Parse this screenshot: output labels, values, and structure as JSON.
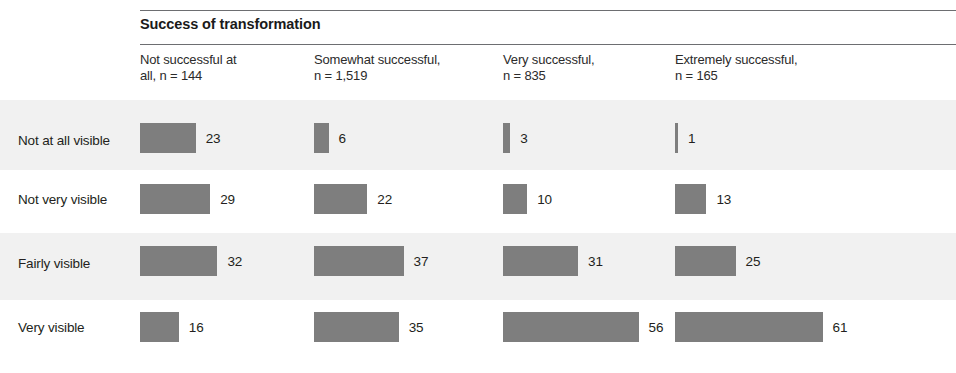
{
  "chart_data": {
    "type": "bar",
    "title": "Success of transformation",
    "orientation": "horizontal",
    "grouped_by": "column",
    "grid": false,
    "legend": "none",
    "xlabel": "",
    "ylabel": "",
    "value_unit": "percent",
    "categories": [
      "Not at all visible",
      "Not very visible",
      "Fairly visible",
      "Very visible"
    ],
    "series": [
      {
        "name": "Not successful at all, n = 144",
        "values": [
          23,
          29,
          32,
          16
        ]
      },
      {
        "name": "Somewhat successful, n = 1,519",
        "values": [
          6,
          22,
          37,
          35
        ]
      },
      {
        "name": "Very successful, n = 835",
        "values": [
          3,
          10,
          31,
          56
        ]
      },
      {
        "name": "Extremely successful, n = 165",
        "values": [
          1,
          13,
          25,
          61
        ]
      }
    ],
    "xlim": [
      0,
      65
    ]
  },
  "header": {
    "group_title": "Success of transformation",
    "columns": [
      {
        "label": "Not successful at\nall, n = 144",
        "name": "Not successful at all",
        "n": "144"
      },
      {
        "label": "Somewhat successful,\nn = 1,519",
        "name": "Somewhat successful",
        "n": "1,519"
      },
      {
        "label": "Very successful,\nn = 835",
        "name": "Very successful",
        "n": "835"
      },
      {
        "label": "Extremely successful,\nn = 165",
        "name": "Extremely successful",
        "n": "165"
      }
    ]
  },
  "rows": [
    {
      "label": "Not at all visible",
      "cells": [
        {
          "value": 23,
          "text": "23"
        },
        {
          "value": 6,
          "text": "6"
        },
        {
          "value": 3,
          "text": "3"
        },
        {
          "value": 1,
          "text": "1"
        }
      ]
    },
    {
      "label": "Not very visible",
      "cells": [
        {
          "value": 29,
          "text": "29"
        },
        {
          "value": 22,
          "text": "22"
        },
        {
          "value": 10,
          "text": "10"
        },
        {
          "value": 13,
          "text": "13"
        }
      ]
    },
    {
      "label": "Fairly visible",
      "cells": [
        {
          "value": 32,
          "text": "32"
        },
        {
          "value": 37,
          "text": "37"
        },
        {
          "value": 31,
          "text": "31"
        },
        {
          "value": 25,
          "text": "25"
        }
      ]
    },
    {
      "label": "Very visible",
      "cells": [
        {
          "value": 16,
          "text": "16"
        },
        {
          "value": 35,
          "text": "35"
        },
        {
          "value": 56,
          "text": "56"
        },
        {
          "value": 61,
          "text": "61"
        }
      ]
    }
  ],
  "colors": {
    "bar": "#7e7e7e",
    "rule": "#6d6e71",
    "band_shaded": "#f1f1f1",
    "band_plain": "#ffffff",
    "text": "#231f20"
  },
  "layout": {
    "column_x": [
      140,
      314,
      503,
      675
    ],
    "bar_scale_px_per_unit": 2.42,
    "bar_height": 30,
    "band_tops": [
      100,
      170,
      233,
      300
    ],
    "band_heights": [
      70,
      63,
      67,
      68
    ],
    "bar_tops": [
      123,
      184,
      246,
      312
    ],
    "label_tops": [
      133,
      192,
      256,
      320
    ]
  }
}
